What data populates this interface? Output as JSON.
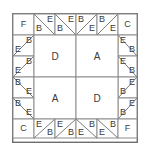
{
  "figure": {
    "grid": {
      "cols": 6,
      "rows": 6,
      "cell_px": 21
    },
    "colors": {
      "background": "#ffffff",
      "patch_fill": "#ffffff",
      "grid_stroke": "#8d8d8d",
      "diagonal_stroke": "#7d7d7d",
      "frame_stroke": "#6e6e6e",
      "label_text": "#3b3b3b"
    },
    "corners": [
      {
        "name": "corner-top-left",
        "label": "F",
        "col": 0,
        "row": 0
      },
      {
        "name": "corner-top-right",
        "label": "C",
        "col": 5,
        "row": 0
      },
      {
        "name": "corner-bottom-left",
        "label": "C",
        "col": 0,
        "row": 5
      },
      {
        "name": "corner-bottom-right",
        "label": "F",
        "col": 5,
        "row": 5
      }
    ],
    "center": [
      {
        "name": "center-top-left",
        "label": "D",
        "col": 1,
        "row": 1
      },
      {
        "name": "center-top-right",
        "label": "A",
        "col": 3,
        "row": 1
      },
      {
        "name": "center-bottom-left",
        "label": "A",
        "col": 1,
        "row": 3
      },
      {
        "name": "center-bottom-right",
        "label": "D",
        "col": 3,
        "row": 3
      }
    ],
    "edge_cells": [
      {
        "name": "top-edge-1",
        "col": 1,
        "row": 0,
        "diagonal": "tl-br",
        "first": "B",
        "second": "E"
      },
      {
        "name": "top-edge-2",
        "col": 2,
        "row": 0,
        "diagonal": "tl-br",
        "first": "B",
        "second": "E"
      },
      {
        "name": "top-edge-3",
        "col": 3,
        "row": 0,
        "diagonal": "tl-br",
        "first": "B",
        "second": "E"
      },
      {
        "name": "top-edge-4",
        "col": 4,
        "row": 0,
        "diagonal": "tl-br",
        "first": "B",
        "second": "E"
      },
      {
        "name": "left-edge-1",
        "col": 0,
        "row": 1,
        "diagonal": "tr-bl",
        "first": "B",
        "second": "E"
      },
      {
        "name": "left-edge-2",
        "col": 0,
        "row": 2,
        "diagonal": "tr-bl",
        "first": "B",
        "second": "E"
      },
      {
        "name": "left-edge-3",
        "col": 0,
        "row": 3,
        "diagonal": "tl-br",
        "first": "B",
        "second": "E"
      },
      {
        "name": "left-edge-4",
        "col": 0,
        "row": 4,
        "diagonal": "tl-br",
        "first": "B",
        "second": "E"
      },
      {
        "name": "right-edge-1",
        "col": 5,
        "row": 1,
        "diagonal": "tl-br",
        "first": "E",
        "second": "B"
      },
      {
        "name": "right-edge-2",
        "col": 5,
        "row": 2,
        "diagonal": "tl-br",
        "first": "E",
        "second": "B"
      },
      {
        "name": "right-edge-3",
        "col": 5,
        "row": 3,
        "diagonal": "tr-bl",
        "first": "E",
        "second": "B"
      },
      {
        "name": "right-edge-4",
        "col": 5,
        "row": 4,
        "diagonal": "tr-bl",
        "first": "E",
        "second": "B"
      },
      {
        "name": "bottom-edge-1",
        "col": 1,
        "row": 5,
        "diagonal": "tr-bl",
        "first": "E",
        "second": "B"
      },
      {
        "name": "bottom-edge-2",
        "col": 2,
        "row": 5,
        "diagonal": "tr-bl",
        "first": "E",
        "second": "B"
      },
      {
        "name": "bottom-edge-3",
        "col": 3,
        "row": 5,
        "diagonal": "tr-bl",
        "first": "E",
        "second": "B"
      },
      {
        "name": "bottom-edge-4",
        "col": 4,
        "row": 5,
        "diagonal": "tr-bl",
        "first": "E",
        "second": "B"
      }
    ],
    "labels": {
      "corner_tl": "F",
      "corner_tr": "C",
      "corner_bl": "C",
      "corner_br": "F",
      "center_tl": "D",
      "center_tr": "A",
      "center_bl": "A",
      "center_br": "D",
      "patch_b": "B",
      "patch_e": "E",
      "top1_lower": "B",
      "top1_upper": "E",
      "top2_lower": "B",
      "top2_upper": "E",
      "top3_upper": "B",
      "top3_lower": "E",
      "top4_upper": "B",
      "top4_lower": "E",
      "left1_upper": "B",
      "left1_lower": "E",
      "left2_upper": "B",
      "left2_lower": "E",
      "left3_upper": "B",
      "left3_lower": "E",
      "left4_upper": "B",
      "left4_lower": "E",
      "right1_upper": "E",
      "right1_lower": "B",
      "right2_upper": "E",
      "right2_lower": "B",
      "right3_upper": "E",
      "right3_lower": "B",
      "right4_upper": "E",
      "right4_lower": "B",
      "bottom1_upper": "E",
      "bottom1_lower": "B",
      "bottom2_upper": "E",
      "bottom2_lower": "B",
      "bottom3_upper": "B",
      "bottom3_lower": "E",
      "bottom4_upper": "B",
      "bottom4_lower": "E"
    }
  }
}
